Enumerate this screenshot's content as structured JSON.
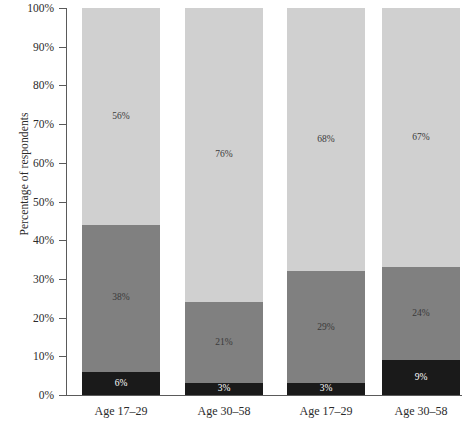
{
  "chart_data": {
    "type": "bar",
    "subtype": "stacked-100-percent",
    "title": "",
    "xlabel": "",
    "ylabel": "Percentage of respondents",
    "ylim": [
      0,
      100
    ],
    "grid": false,
    "legend_position": "none",
    "categories": [
      "Age 17–29",
      "Age 30–58",
      "Age 17–29",
      "Age 30–58"
    ],
    "series": [
      {
        "name": "dark",
        "color": "#1a1a1a",
        "values": [
          6,
          3,
          3,
          9
        ]
      },
      {
        "name": "medium",
        "color": "#808080",
        "values": [
          38,
          21,
          29,
          24
        ]
      },
      {
        "name": "light",
        "color": "#d0d0d0",
        "values": [
          56,
          76,
          68,
          67
        ]
      }
    ],
    "value_labels": [
      [
        "6%",
        "38%",
        "56%"
      ],
      [
        "3%",
        "21%",
        "76%"
      ],
      [
        "3%",
        "29%",
        "68%"
      ],
      [
        "9%",
        "24%",
        "67%"
      ]
    ],
    "yticks": [
      0,
      10,
      20,
      30,
      40,
      50,
      60,
      70,
      80,
      90,
      100
    ],
    "ytick_labels": [
      "0%",
      "10%",
      "20%",
      "30%",
      "40%",
      "50%",
      "60%",
      "70%",
      "80%",
      "90%",
      "100%"
    ]
  },
  "axis": {
    "y_title": "Percentage of respondents"
  },
  "colors": {
    "segment_dark": "#1a1a1a",
    "segment_medium": "#808080",
    "segment_light": "#d0d0d0",
    "axis": "#5a5a5a",
    "text": "#2b2b2b",
    "background": "#ffffff"
  }
}
